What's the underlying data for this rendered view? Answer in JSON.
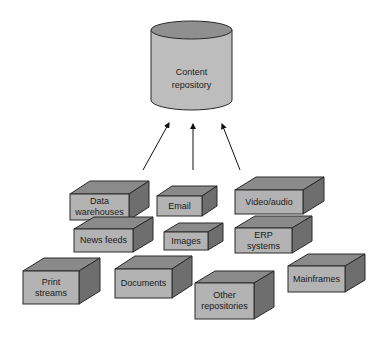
{
  "repository": {
    "line1": "Content",
    "line2": "repository"
  },
  "colors": {
    "front": "#b3b3b3",
    "top": "#8a8a8a",
    "side": "#6e6e6e",
    "cyl_body": "#bdbdbd",
    "cyl_top": "#8f8f8f",
    "stroke": "#2a2a2a"
  },
  "sources": [
    {
      "id": "data-warehouses",
      "lines": [
        "Data",
        "warehouses"
      ]
    },
    {
      "id": "email",
      "lines": [
        "Email"
      ]
    },
    {
      "id": "video-audio",
      "lines": [
        "Video/audio"
      ]
    },
    {
      "id": "news-feeds",
      "lines": [
        "News feeds"
      ]
    },
    {
      "id": "images",
      "lines": [
        "Images"
      ]
    },
    {
      "id": "erp-systems",
      "lines": [
        "ERP",
        "systems"
      ]
    },
    {
      "id": "print-streams",
      "lines": [
        "Print",
        "streams"
      ]
    },
    {
      "id": "documents",
      "lines": [
        "Documents"
      ]
    },
    {
      "id": "other-repositories",
      "lines": [
        "Other",
        "repositories"
      ]
    },
    {
      "id": "mainframes",
      "lines": [
        "Mainframes"
      ]
    }
  ]
}
